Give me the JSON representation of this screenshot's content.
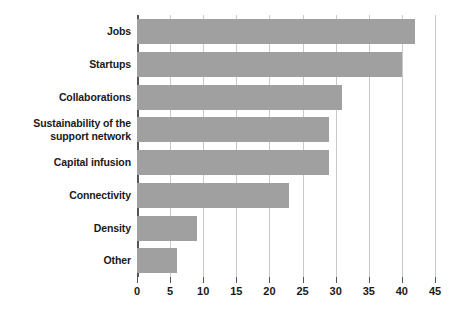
{
  "chart_data": {
    "type": "bar",
    "orientation": "horizontal",
    "title": "",
    "subtitle": "",
    "xlabel": "",
    "ylabel": "",
    "xlim": [
      0,
      45
    ],
    "xticks": [
      0,
      5,
      10,
      15,
      20,
      25,
      30,
      35,
      40,
      45
    ],
    "xtick_labels": [
      "0",
      "5",
      "10",
      "15",
      "20",
      "25",
      "30",
      "35",
      "40",
      "45"
    ],
    "grid": true,
    "grid_axis": "x",
    "legend": false,
    "legend_position": "none",
    "categories": [
      "Jobs",
      "Startups",
      "Collaborations",
      "Sustainability of the support network",
      "Capital infusion",
      "Connectivity",
      "Density",
      "Other"
    ],
    "category_label_lines": [
      [
        "Jobs"
      ],
      [
        "Startups"
      ],
      [
        "Collaborations"
      ],
      [
        "Sustainability of the",
        "support network"
      ],
      [
        "Capital infusion"
      ],
      [
        "Connectivity"
      ],
      [
        "Density"
      ],
      [
        "Other"
      ]
    ],
    "values": [
      42,
      40,
      31,
      29,
      29,
      23,
      9,
      6
    ],
    "bar_color": "#a0a0a0",
    "axis_color": "#555555",
    "grid_color": "#c9c9c9",
    "text_color": "#1a1a1a",
    "background_color": "#ffffff"
  }
}
